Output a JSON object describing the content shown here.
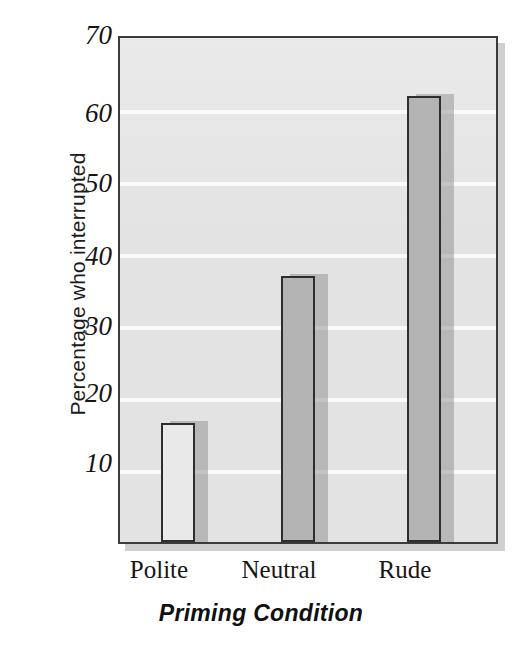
{
  "chart_data": {
    "type": "bar",
    "title": "",
    "subtitle": "",
    "xlabel": "Priming Condition",
    "ylabel": "Percentage who interrupted",
    "categories": [
      "Polite",
      "Neutral",
      "Rude"
    ],
    "values": [
      16.5,
      37,
      62
    ],
    "series": [
      {
        "name": "Percentage who interrupted",
        "values": [
          16.5,
          37,
          62
        ]
      }
    ],
    "ylim": [
      0,
      70
    ],
    "ytick_labels": [
      "70",
      "60",
      "50",
      "40",
      "30",
      "20",
      "10"
    ],
    "ytick_values": [
      70,
      60,
      50,
      40,
      30,
      20,
      10
    ],
    "grid": true,
    "grid_axis": "y",
    "legend": false,
    "legend_position": "none",
    "annotations": [],
    "bar_colors": [
      "#e9e9e9",
      "#b4b4b4",
      "#b4b4b4"
    ],
    "bar_edge_color": "#2e2e2e",
    "plot_background": "#e3e3e3",
    "gridline_color": "#fbfbfb"
  },
  "axes": {
    "y_tick_0": "70",
    "y_tick_1": "60",
    "y_tick_2": "50",
    "y_tick_3": "40",
    "y_tick_4": "30",
    "y_tick_5": "20",
    "y_tick_6": "10"
  },
  "bars": {
    "bar_0_label": "Polite",
    "bar_1_label": "Neutral",
    "bar_2_label": "Rude"
  }
}
